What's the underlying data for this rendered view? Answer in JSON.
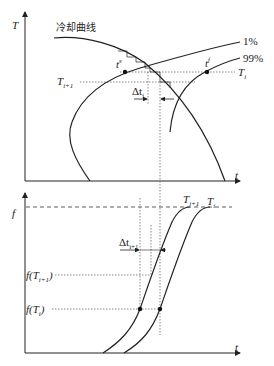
{
  "top_plot": {
    "y_axis_label": "T",
    "x_axis_label": "t",
    "curves": {
      "cooling_curve_label": "冷却曲线",
      "start_curve_label": "1%",
      "finish_curve_label": "99%"
    },
    "levels": {
      "T_i": "T",
      "T_i_sub": "i",
      "T_i1": "T",
      "T_i1_sub": "i+1"
    },
    "points": {
      "t_start": "t",
      "t_start_sup": "s",
      "t_start_sub": "i",
      "t_finish": "t",
      "t_finish_sup": "f",
      "t_finish_sub": "i"
    },
    "interval": {
      "label": "Δt",
      "sub": "i"
    }
  },
  "bottom_plot": {
    "y_axis_label": "f",
    "x_axis_label": "t",
    "curve_labels": [
      {
        "main": "T",
        "sub": "i+1"
      },
      {
        "main": "T",
        "sub": "i"
      }
    ],
    "levels": {
      "f_T_i1": "f(T",
      "f_T_i1_sub": "i+1",
      "f_T_i1_close": ")",
      "f_T_i": "f(T",
      "f_T_i_sub": "i",
      "f_T_i_close": ")"
    },
    "interval": {
      "label": "Δt",
      "sub": "i+1"
    }
  },
  "colors": {
    "line": "#222222",
    "guide": "#555555"
  }
}
